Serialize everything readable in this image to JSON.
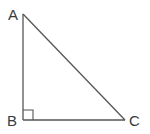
{
  "diagram": {
    "type": "right-triangle",
    "colors": {
      "line": "#555555",
      "label": "#3a3a3a",
      "background": "#ffffff"
    },
    "vertices": [
      {
        "id": "A",
        "label": "A",
        "x": 23,
        "y": 14
      },
      {
        "id": "B",
        "label": "B",
        "x": 23,
        "y": 120
      },
      {
        "id": "C",
        "label": "C",
        "x": 125,
        "y": 120
      }
    ],
    "right_angle_at": "B",
    "right_angle_marker_size": 10
  }
}
